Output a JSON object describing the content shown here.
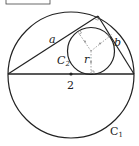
{
  "diagram": {
    "labels": {
      "side_a": "a",
      "side_b": "b",
      "inner_circle": "C",
      "inner_circle_sub": "2",
      "radius": "r",
      "center_value": "2",
      "outer_circle": "C",
      "outer_circle_sub": "1"
    },
    "colors": {
      "stroke": "#222222",
      "dashed": "#888888",
      "background": "#ffffff"
    }
  }
}
